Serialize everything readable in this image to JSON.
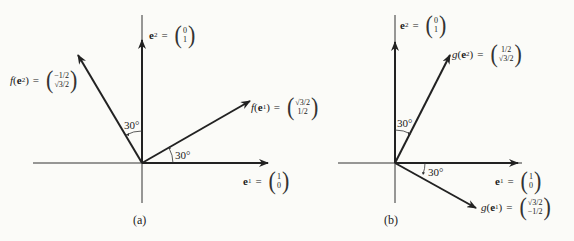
{
  "panels": [
    {
      "caption": "(a)",
      "vectors": {
        "e1": {
          "name": "e",
          "sub": "1",
          "top": "1",
          "bottom": "0"
        },
        "e2": {
          "name": "e",
          "sub": "2",
          "top": "0",
          "bottom": "1"
        },
        "fe1": {
          "fn": "f",
          "name": "e",
          "sub": "1",
          "top": "√3/2",
          "bottom": "1/2"
        },
        "fe2": {
          "fn": "f",
          "name": "e",
          "sub": "2",
          "top": "−1/2",
          "bottom": "√3/2"
        }
      },
      "angles": [
        "30°",
        "30°"
      ]
    },
    {
      "caption": "(b)",
      "vectors": {
        "e1": {
          "name": "e",
          "sub": "1",
          "top": "1",
          "bottom": "0"
        },
        "e2": {
          "name": "e",
          "sub": "2",
          "top": "0",
          "bottom": "1"
        },
        "ge1": {
          "fn": "g",
          "name": "e",
          "sub": "1",
          "top": "√3/2",
          "bottom": "−1/2"
        },
        "ge2": {
          "fn": "g",
          "name": "e",
          "sub": "2",
          "top": "1/2",
          "bottom": "√3/2"
        }
      },
      "angles": [
        "30°",
        "30°"
      ]
    }
  ],
  "symbols": {
    "equals": "=",
    "open": "(",
    "close": ")",
    "lparen": "(",
    "rparen": ")"
  }
}
